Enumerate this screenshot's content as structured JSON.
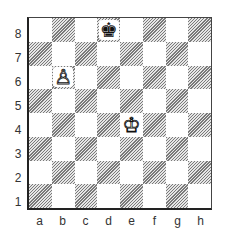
{
  "board": {
    "ranks": [
      "8",
      "7",
      "6",
      "5",
      "4",
      "3",
      "2",
      "1"
    ],
    "files": [
      "a",
      "b",
      "c",
      "d",
      "e",
      "f",
      "g",
      "h"
    ],
    "light_color": "#ffffff",
    "dark_pattern": "diagonal-hatch",
    "pieces": [
      {
        "square": "d8",
        "type": "king",
        "color": "black",
        "glyph": "♚"
      },
      {
        "square": "b6",
        "type": "pawn",
        "color": "white",
        "glyph": "♙"
      },
      {
        "square": "e4",
        "type": "king",
        "color": "white",
        "glyph": "♔"
      }
    ]
  }
}
